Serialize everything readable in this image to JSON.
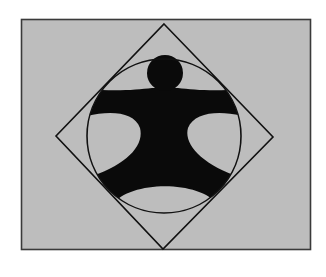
{
  "figure": {
    "colors": {
      "background": "#ffffff",
      "panel_fill": "#bdbdbd",
      "panel_stroke": "#3a3a3a",
      "line": "#111111",
      "figure_fill": "#0a0a0a"
    },
    "panel": {
      "x": 21,
      "y": 19,
      "width": 290,
      "height": 231
    },
    "diamond": {
      "top": [
        164,
        24
      ],
      "right": [
        273,
        137
      ],
      "bottom": [
        163,
        249
      ],
      "left": [
        56,
        136
      ]
    },
    "circle": {
      "cx": 164,
      "cy": 136,
      "r": 77
    },
    "head": {
      "cx": 165,
      "cy": 73,
      "r": 18
    }
  }
}
